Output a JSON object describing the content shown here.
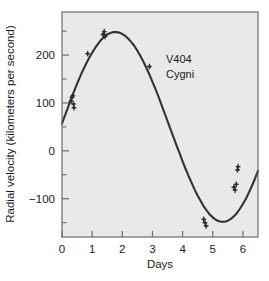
{
  "chart_data": {
    "type": "line",
    "title": "",
    "annotation": "V404 Cygni",
    "annotation_line1": "V404",
    "annotation_line2": "Cygni",
    "xlabel": "Days",
    "ylabel": "Radial velocity (kilometers per second)",
    "xlim": [
      0,
      6.5
    ],
    "ylim": [
      -180,
      290
    ],
    "xticks": [
      0,
      1,
      2,
      3,
      4,
      5,
      6
    ],
    "xtick_labels": [
      "0",
      "1",
      "2",
      "3",
      "4",
      "5",
      "6"
    ],
    "yticks": [
      -100,
      0,
      100,
      200
    ],
    "ytick_labels": [
      "−100",
      "0",
      "100",
      "200"
    ],
    "y_minor_ticks": [
      -150,
      -50,
      50,
      150,
      250
    ],
    "grid": false,
    "legend": null,
    "curve": {
      "name": "radial velocity fit",
      "model": "sinusoid",
      "amplitude": 211,
      "mean_velocity": 58,
      "period_days": 6.47,
      "phase_offset_days": 1.75,
      "color": "#333333",
      "x": [
        0.0,
        0.1,
        0.2,
        0.3,
        0.4,
        0.5,
        0.6,
        0.7,
        0.8,
        0.9,
        1.0,
        1.1,
        1.2,
        1.3,
        1.4,
        1.5,
        1.6,
        1.7,
        1.8,
        1.9,
        2.0,
        2.1,
        2.2,
        2.3,
        2.4,
        2.5,
        2.6,
        2.7,
        2.8,
        2.9,
        3.0,
        3.1,
        3.2,
        3.3,
        3.4,
        3.5,
        3.6,
        3.7,
        3.8,
        3.9,
        4.0,
        4.1,
        4.2,
        4.3,
        4.4,
        4.5,
        4.6,
        4.7,
        4.8,
        4.9,
        5.0,
        5.1,
        5.2,
        5.3,
        5.4,
        5.5,
        5.6,
        5.7,
        5.8,
        5.9,
        6.0,
        6.1,
        6.2,
        6.3,
        6.4,
        6.5
      ],
      "y": [
        57,
        74,
        91,
        108,
        124,
        140,
        155,
        169,
        182,
        194,
        205,
        215,
        224,
        232,
        238,
        243,
        246,
        248,
        248,
        247,
        244,
        240,
        234,
        227,
        219,
        209,
        198,
        186,
        173,
        159,
        144,
        129,
        113,
        96,
        79,
        62,
        45,
        28,
        11,
        -5,
        -22,
        -38,
        -53,
        -67,
        -81,
        -94,
        -105,
        -116,
        -125,
        -133,
        -139,
        -144,
        -147,
        -148,
        -148,
        -146,
        -142,
        -137,
        -130,
        -121,
        -111,
        -100,
        -87,
        -73,
        -58,
        -42
      ]
    },
    "points": [
      {
        "x": 0.3,
        "y": 104
      },
      {
        "x": 0.33,
        "y": 112
      },
      {
        "x": 0.36,
        "y": 115
      },
      {
        "x": 0.38,
        "y": 98
      },
      {
        "x": 0.4,
        "y": 90
      },
      {
        "x": 0.85,
        "y": 203
      },
      {
        "x": 1.36,
        "y": 243
      },
      {
        "x": 1.4,
        "y": 249
      },
      {
        "x": 1.43,
        "y": 239
      },
      {
        "x": 2.9,
        "y": 176
      },
      {
        "x": 4.7,
        "y": -143
      },
      {
        "x": 4.74,
        "y": -150
      },
      {
        "x": 4.78,
        "y": -157
      },
      {
        "x": 5.7,
        "y": -76
      },
      {
        "x": 5.74,
        "y": -82
      },
      {
        "x": 5.78,
        "y": -70
      },
      {
        "x": 5.82,
        "y": -40
      },
      {
        "x": 5.84,
        "y": -33
      }
    ],
    "marker_color": "#2b2b2b",
    "plot_background": "#e9e9e9",
    "page_background": "#ffffff",
    "axis_color": "#6b6b6b"
  }
}
